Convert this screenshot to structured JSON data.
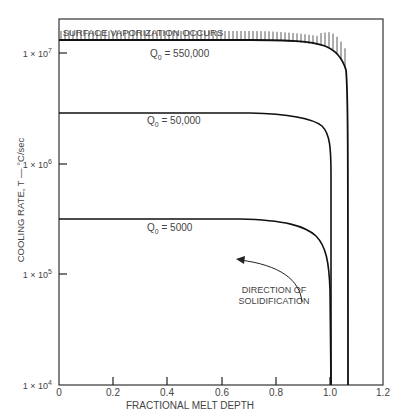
{
  "chart_data": {
    "type": "line",
    "title": "",
    "xlabel": "FRACTIONAL MELT DEPTH",
    "ylabel": "COOLING RATE, T — °C/sec",
    "xlim": [
      0,
      1.2
    ],
    "ylim": [
      10000,
      20000000
    ],
    "yscale": "log",
    "grid": false,
    "x_ticks": [
      "0",
      "0.2",
      "0.4",
      "0.6",
      "0.8",
      "1.0",
      "1.2"
    ],
    "y_ticks": [
      {
        "base": "1 × 10",
        "exp": "4",
        "value": 10000
      },
      {
        "base": "1 × 10",
        "exp": "5",
        "value": 100000
      },
      {
        "base": "1 × 10",
        "exp": "6",
        "value": 1000000
      },
      {
        "base": "1 × 10",
        "exp": "7",
        "value": 10000000
      }
    ],
    "series": [
      {
        "name": "Q0 = 550,000",
        "label_main": "Q",
        "label_sub": "0",
        "label_rest": " = 550,000",
        "x": [
          0,
          0.2,
          0.4,
          0.6,
          0.8,
          0.9,
          0.95,
          1.0,
          1.03,
          1.05,
          1.06,
          1.06
        ],
        "y": [
          14000000,
          14000000,
          13800000,
          13500000,
          13000000,
          12000000,
          11000000,
          9000000,
          6000000,
          2000000,
          100000,
          10000
        ]
      },
      {
        "name": "Q0 = 50,000",
        "label_main": "Q",
        "label_sub": "0",
        "label_rest": " = 50,000",
        "x": [
          0,
          0.2,
          0.4,
          0.6,
          0.8,
          0.9,
          0.95,
          0.98,
          1.0,
          1.0
        ],
        "y": [
          3000000,
          3000000,
          2950000,
          2900000,
          2800000,
          2500000,
          2000000,
          1200000,
          400000,
          10000
        ]
      },
      {
        "name": "Q0 = 5000",
        "label_main": "Q",
        "label_sub": "0",
        "label_rest": " = 5000",
        "x": [
          0,
          0.2,
          0.4,
          0.6,
          0.8,
          0.9,
          0.95,
          0.98,
          1.0,
          1.0
        ],
        "y": [
          310000,
          310000,
          305000,
          300000,
          290000,
          260000,
          210000,
          140000,
          60000,
          10000
        ]
      }
    ],
    "annotations": [
      {
        "text": "SURFACE VAPORIZATION OCCURS",
        "note": "hatched region above Q0 = 550,000 curve"
      },
      {
        "text_line1": "DIRECTION OF",
        "text_line2": "SOLIDIFICATION",
        "note": "curved arrow pointing upward-left"
      }
    ],
    "colors": {
      "line": "#111111",
      "frame": "#333333",
      "text": "#444444"
    }
  }
}
